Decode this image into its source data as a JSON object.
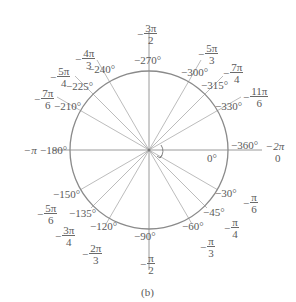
{
  "figure": {
    "caption": "(b)",
    "center": [
      149,
      150
    ],
    "radius": 79,
    "circle_color": "#8a8a8a",
    "line_color": "#b0b0b0",
    "rotation_arrow": "clockwise",
    "degree_labels": [
      {
        "deg": "0°",
        "angle": 0
      },
      {
        "deg": "−30°",
        "angle": 30
      },
      {
        "deg": "−45°",
        "angle": 45
      },
      {
        "deg": "−60°",
        "angle": 60
      },
      {
        "deg": "−90°",
        "angle": 90
      },
      {
        "deg": "−120°",
        "angle": 120
      },
      {
        "deg": "−135°",
        "angle": 135
      },
      {
        "deg": "−150°",
        "angle": 150
      },
      {
        "deg": "−180°",
        "angle": 180
      },
      {
        "deg": "−210°",
        "angle": 210
      },
      {
        "deg": "−225°",
        "angle": 225
      },
      {
        "deg": "−240°",
        "angle": 240
      },
      {
        "deg": "−270°",
        "angle": 270
      },
      {
        "deg": "−300°",
        "angle": 300
      },
      {
        "deg": "−315°",
        "angle": 315
      },
      {
        "deg": "−330°",
        "angle": 330
      },
      {
        "deg": "−360°",
        "angle": 360
      }
    ],
    "radian_labels": [
      {
        "sign": "",
        "num": "0",
        "den": "",
        "angle": 0
      },
      {
        "sign": "−",
        "num": "π",
        "den": "6",
        "angle": 30
      },
      {
        "sign": "−",
        "num": "π",
        "den": "4",
        "angle": 45
      },
      {
        "sign": "−",
        "num": "π",
        "den": "3",
        "angle": 60
      },
      {
        "sign": "−",
        "num": "π",
        "den": "2",
        "angle": 90
      },
      {
        "sign": "−",
        "num": "2π",
        "den": "3",
        "angle": 120
      },
      {
        "sign": "−",
        "num": "3π",
        "den": "4",
        "angle": 135
      },
      {
        "sign": "−",
        "num": "5π",
        "den": "6",
        "angle": 150
      },
      {
        "sign": "−",
        "num": "π",
        "den": "",
        "angle": 180
      },
      {
        "sign": "−",
        "num": "7π",
        "den": "6",
        "angle": 210
      },
      {
        "sign": "−",
        "num": "5π",
        "den": "4",
        "angle": 225
      },
      {
        "sign": "−",
        "num": "4π",
        "den": "3",
        "angle": 240
      },
      {
        "sign": "−",
        "num": "3π",
        "den": "2",
        "angle": 270
      },
      {
        "sign": "−",
        "num": "5π",
        "den": "3",
        "angle": 300
      },
      {
        "sign": "−",
        "num": "7π",
        "den": "4",
        "angle": 315
      },
      {
        "sign": "−",
        "num": "11π",
        "den": "6",
        "angle": 330
      },
      {
        "sign": "−",
        "num": "2π",
        "den": "",
        "angle": 360
      }
    ]
  }
}
